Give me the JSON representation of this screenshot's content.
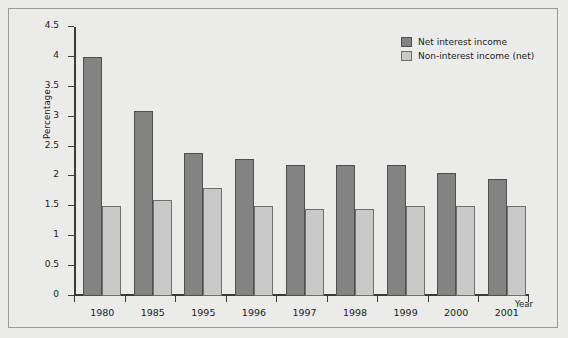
{
  "chart_data": {
    "type": "bar",
    "title": "",
    "xlabel": "Year",
    "ylabel": "Percentage",
    "categories": [
      "1980",
      "1985",
      "1995",
      "1996",
      "1997",
      "1998",
      "1999",
      "2000",
      "2001"
    ],
    "series": [
      {
        "name": "Net interest income",
        "color": "#838383",
        "values": [
          4.0,
          3.1,
          2.4,
          2.3,
          2.2,
          2.2,
          2.2,
          2.05,
          1.95
        ]
      },
      {
        "name": "Non-interest income (net)",
        "color": "#c9c9c9",
        "values": [
          1.5,
          1.6,
          1.8,
          1.5,
          1.45,
          1.45,
          1.5,
          1.5,
          1.5
        ]
      }
    ],
    "ylim": [
      0,
      4.5
    ],
    "yticks": [
      "0",
      "0.5",
      "1",
      "1.5",
      "2",
      "2.5",
      "3",
      "3.5",
      "4",
      "4.5"
    ],
    "ytick_values": [
      0,
      0.5,
      1,
      1.5,
      2,
      2.5,
      3,
      3.5,
      4,
      4.5
    ],
    "grid": false,
    "legend_position": "top-right"
  },
  "colors": {
    "background": "#ebebea",
    "frame_border": "#9a9a9a",
    "axis": "#3a3a3a",
    "text": "#1b1b1b"
  }
}
